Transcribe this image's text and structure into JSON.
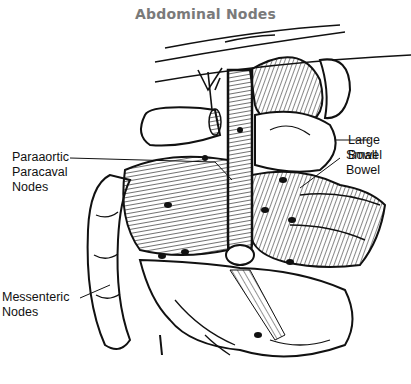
{
  "title": "Abdominal Nodes",
  "labels": {
    "paraaortic": [
      "Paraaortic",
      "Paracaval",
      "Nodes"
    ],
    "large_bowel": "Large Bowel",
    "small_bowel": "Small Bowel",
    "messenteric": [
      "Messenteric",
      "Nodes"
    ]
  },
  "colors": {
    "title": "#7a7a7a",
    "ink": "#111111",
    "background": "#ffffff"
  }
}
